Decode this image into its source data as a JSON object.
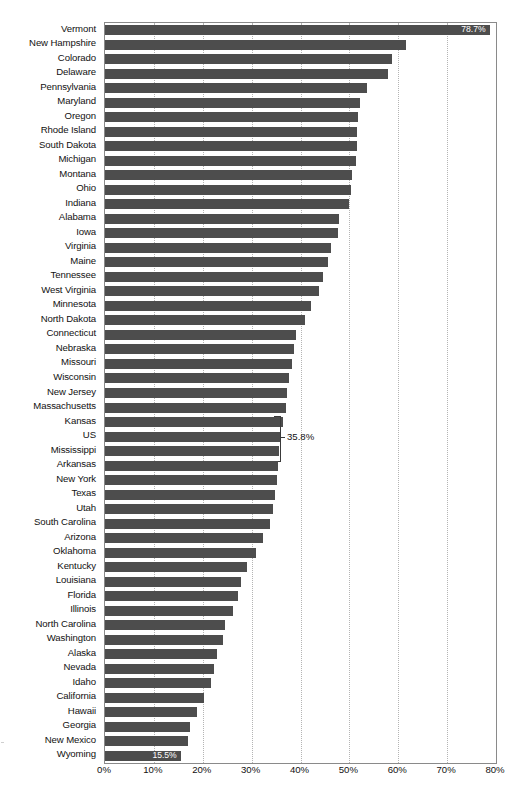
{
  "chart_data": {
    "type": "bar",
    "orientation": "horizontal",
    "title": "",
    "subtitle": "",
    "xlabel": "",
    "ylabel": "",
    "xlim": [
      0,
      80
    ],
    "xunit": "%",
    "grid": true,
    "legend": null,
    "bar_color": "#4d4d4d",
    "axis_color": "#8a8a8a",
    "gridline_color": "#b4b4b4",
    "xticks": [
      "0%",
      "10%",
      "20%",
      "30%",
      "40%",
      "50%",
      "60%",
      "70%",
      "80%"
    ],
    "xtick_values": [
      0,
      10,
      20,
      30,
      40,
      50,
      60,
      70,
      80
    ],
    "categories": [
      "Vermont",
      "New Hampshire",
      "Colorado",
      "Delaware",
      "Pennsylvania",
      "Maryland",
      "Oregon",
      "Rhode Island",
      "South Dakota",
      "Michigan",
      "Montana",
      "Ohio",
      "Indiana",
      "Alabama",
      "Iowa",
      "Virginia",
      "Maine",
      "Tennessee",
      "West Virginia",
      "Minnesota",
      "North Dakota",
      "Connecticut",
      "Nebraska",
      "Missouri",
      "Wisconsin",
      "New Jersey",
      "Massachusetts",
      "Kansas",
      "US",
      "Mississippi",
      "Arkansas",
      "New York",
      "Texas",
      "Utah",
      "South Carolina",
      "Arizona",
      "Oklahoma",
      "Kentucky",
      "Louisiana",
      "Florida",
      "Illinois",
      "North Carolina",
      "Washington",
      "Alaska",
      "Nevada",
      "Idaho",
      "California",
      "Hawaii",
      "Georgia",
      "New Mexico",
      "Wyoming"
    ],
    "values": [
      78.7,
      61.6,
      58.8,
      58.0,
      53.6,
      52.2,
      51.8,
      51.6,
      51.5,
      51.3,
      50.6,
      50.3,
      49.9,
      47.9,
      47.6,
      46.3,
      45.6,
      44.6,
      43.8,
      42.2,
      41.0,
      39.0,
      38.6,
      38.2,
      37.6,
      37.3,
      37.0,
      36.4,
      35.8,
      35.6,
      35.4,
      35.2,
      34.7,
      34.4,
      33.7,
      32.4,
      30.8,
      29.0,
      27.8,
      27.3,
      26.2,
      24.6,
      24.1,
      23.0,
      22.2,
      21.6,
      20.2,
      18.8,
      17.3,
      17.0,
      15.5
    ],
    "data_labels": [
      {
        "category": "Vermont",
        "value": 78.7,
        "text": "78.7%",
        "position": "inside-end"
      },
      {
        "category": "US",
        "value": 35.8,
        "text": "35.8%",
        "position": "callout-right"
      },
      {
        "category": "Wyoming",
        "value": 15.5,
        "text": "15.5%",
        "position": "inside-end"
      }
    ],
    "highlighted_category": "US"
  }
}
